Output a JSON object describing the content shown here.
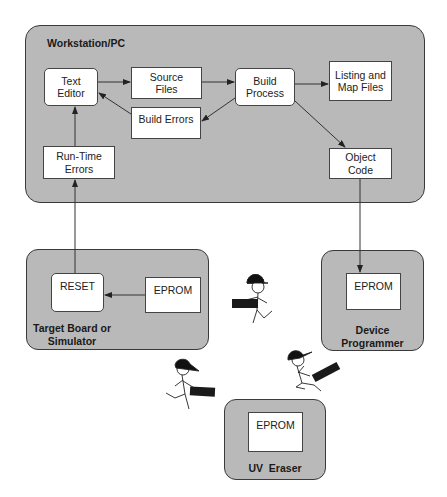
{
  "workstation": {
    "title": "Workstation/PC",
    "nodes": {
      "text_editor": "Text\nEditor",
      "source_files": "Source\nFiles",
      "build_process": "Build\nProcess",
      "listing_map": "Listing and\nMap Files",
      "build_errors": "Build Errors",
      "runtime_errors": "Run-Time\nErrors",
      "object_code": "Object\nCode"
    }
  },
  "target_board": {
    "title": "Target Board or\nSimulator",
    "reset": "RESET",
    "eprom": "EPROM"
  },
  "device_programmer": {
    "title": "Device\nProgrammer",
    "eprom": "EPROM"
  },
  "uv_eraser": {
    "title": "UV  Eraser",
    "eprom": "EPROM"
  },
  "edges": [
    {
      "from": "Text Editor",
      "to": "Source Files"
    },
    {
      "from": "Source Files",
      "to": "Build Process"
    },
    {
      "from": "Build Process",
      "to": "Listing and Map Files"
    },
    {
      "from": "Build Process",
      "to": "Build Errors"
    },
    {
      "from": "Build Errors",
      "to": "Text Editor"
    },
    {
      "from": "Build Process",
      "to": "Object Code"
    },
    {
      "from": "Run-Time Errors",
      "to": "Text Editor"
    },
    {
      "from": "Object Code",
      "to": "Device Programmer EPROM"
    },
    {
      "from": "Target Board EPROM",
      "to": "RESET"
    },
    {
      "from": "RESET",
      "to": "Run-Time Errors"
    }
  ],
  "figures": [
    "courier-carrying-eprom-1",
    "courier-carrying-eprom-2",
    "courier-carrying-eprom-3"
  ],
  "colors": {
    "panel": "#b9b9b9",
    "node": "#ffffff",
    "stroke": "#333333"
  }
}
